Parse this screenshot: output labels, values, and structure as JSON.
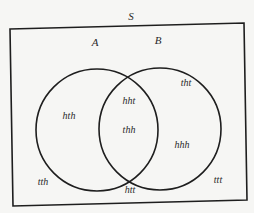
{
  "diagram": {
    "type": "venn",
    "universe": {
      "label": "S",
      "label_pos": [
        131,
        16
      ]
    },
    "sets": [
      {
        "id": "A",
        "label": "A",
        "label_pos": [
          95,
          42
        ],
        "center": [
          97,
          130
        ],
        "radius": 61
      },
      {
        "id": "B",
        "label": "B",
        "label_pos": [
          158,
          40
        ],
        "center": [
          160,
          129
        ],
        "radius": 61
      }
    ],
    "elements": [
      {
        "text": "tht",
        "region": "B only",
        "pos": [
          186,
          83
        ]
      },
      {
        "text": "hht",
        "region": "A and B",
        "pos": [
          129,
          101
        ]
      },
      {
        "text": "hth",
        "region": "A only",
        "pos": [
          69,
          116
        ]
      },
      {
        "text": "thh",
        "region": "A and B",
        "pos": [
          129,
          130
        ]
      },
      {
        "text": "hhh",
        "region": "B only",
        "pos": [
          182,
          145
        ]
      },
      {
        "text": "tth",
        "region": "outside",
        "pos": [
          43,
          182
        ]
      },
      {
        "text": "htt",
        "region": "outside",
        "pos": [
          130,
          190
        ]
      },
      {
        "text": "ttt",
        "region": "outside",
        "pos": [
          218,
          180
        ]
      }
    ],
    "colors": {
      "background": "#f6f6f4",
      "stroke": "#1e1e1e",
      "text": "#2a2a2a"
    }
  }
}
